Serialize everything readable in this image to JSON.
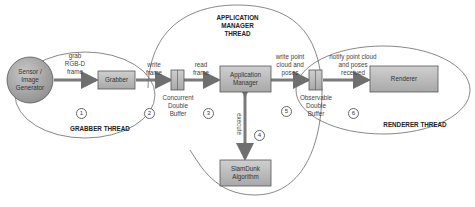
{
  "threads": {
    "grabber": "GRABBER THREAD",
    "app_manager": "APPLICATION\nMANAGER\nTHREAD",
    "renderer": "RENDERER THREAD"
  },
  "nodes": {
    "sensor": "Sensor /\nImage\nGenerator",
    "grabber": "Grabber",
    "concurrent_buffer": "Concurrent\nDouble\nBuffer",
    "app_manager": "Application\nManager",
    "slamdunk": "SlamDunk\nAlgorithm",
    "observable_buffer": "Observable\nDouble\nBuffer",
    "renderer": "Renderer"
  },
  "edges": {
    "e1": {
      "label": "grab\nRGB-D\nframe",
      "step": "1"
    },
    "e2": {
      "label": "write\nframe",
      "step": "2"
    },
    "e3": {
      "label": "read\nframe",
      "step": "3"
    },
    "e4": {
      "label": "execute",
      "step": "4"
    },
    "e5": {
      "label": "write point\ncloud and\nposes",
      "step": "5"
    },
    "e6": {
      "label": "notify point cloud\nand poses\nreceived",
      "step": "6"
    }
  },
  "colors": {
    "box_fill": "#b5b5b5",
    "arrow": "#7a7a7a",
    "outline": "#555555"
  }
}
